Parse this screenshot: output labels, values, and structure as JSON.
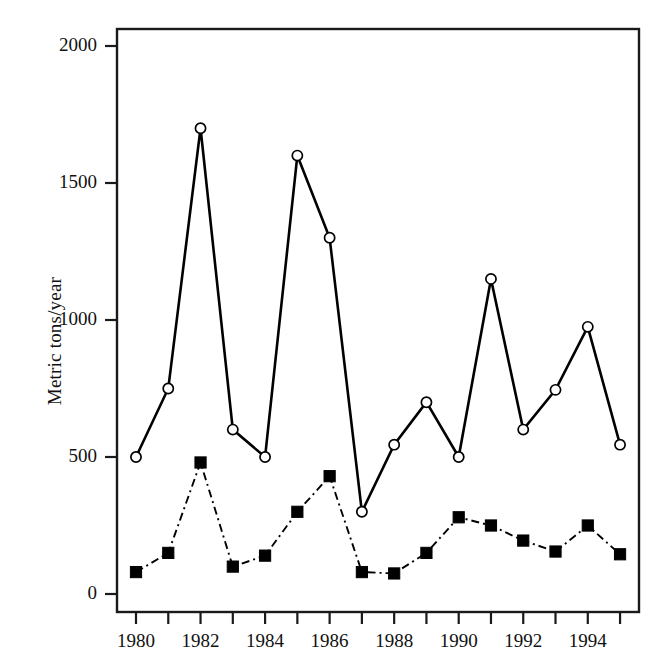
{
  "chart_data": {
    "type": "line",
    "title": "",
    "subtitle": "",
    "xlabel": "",
    "ylabel": "Metric tons/year",
    "x": [
      1980,
      1981,
      1982,
      1983,
      1984,
      1985,
      1986,
      1987,
      1988,
      1989,
      1990,
      1991,
      1992,
      1993,
      1994,
      1995
    ],
    "xlim": [
      1979.4,
      1995.6
    ],
    "ylim": [
      0,
      2100
    ],
    "grid": false,
    "legend": "none",
    "x_tick_values": [
      1980,
      1981,
      1982,
      1983,
      1984,
      1985,
      1986,
      1987,
      1988,
      1989,
      1990,
      1991,
      1992,
      1993,
      1994,
      1995
    ],
    "x_tick_labels": [
      "1980",
      "",
      "1982",
      "",
      "1984",
      "",
      "1986",
      "",
      "1988",
      "",
      "1990",
      "",
      "1992",
      "",
      "1994",
      ""
    ],
    "y_tick_values": [
      0,
      500,
      1000,
      1500,
      2000
    ],
    "y_tick_labels": [
      "0",
      "500",
      "1000",
      "1500",
      "2000"
    ],
    "series": [
      {
        "name": "open-circle-solid-series",
        "marker": "open-circle",
        "linestyle": "solid",
        "color": "#000000",
        "values": [
          500,
          750,
          1700,
          600,
          500,
          1600,
          1300,
          300,
          545,
          700,
          500,
          1150,
          600,
          745,
          975,
          545
        ]
      },
      {
        "name": "filled-square-dashdot-series",
        "marker": "filled-square",
        "linestyle": "dash-dot",
        "color": "#000000",
        "values": [
          80,
          150,
          480,
          100,
          140,
          300,
          430,
          80,
          75,
          150,
          280,
          250,
          195,
          155,
          250,
          145
        ]
      }
    ]
  },
  "axes": {
    "frame_color": "#1a1a1a",
    "tick_color": "#1a1a1a"
  }
}
